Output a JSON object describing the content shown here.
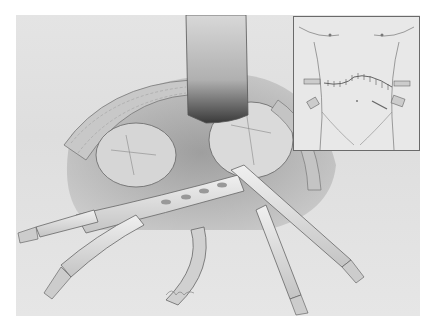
{
  "figure": {
    "type": "surgical-illustration",
    "inset": {
      "description": "Torso outline showing transverse incision with sutures and four drain sites"
    },
    "signature": "artist signature (illegible)"
  },
  "caption": {
    "text": ""
  }
}
